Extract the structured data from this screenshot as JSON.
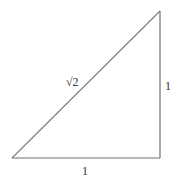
{
  "diagram": {
    "type": "right-triangle",
    "vertices": {
      "bottom_left": [
        12,
        158
      ],
      "bottom_right": [
        160,
        158
      ],
      "top_right": [
        160,
        11
      ]
    },
    "stroke_color": "#777777",
    "labels": {
      "hypotenuse": "√2",
      "base": "1",
      "height": "1"
    }
  }
}
